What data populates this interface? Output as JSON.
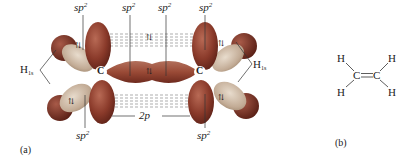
{
  "figure": {
    "panel_a": {
      "caption": "(a)",
      "top_labels": [
        {
          "base": "sp",
          "sup": "2"
        },
        {
          "base": "sp",
          "sup": "2"
        },
        {
          "base": "sp",
          "sup": "2"
        },
        {
          "base": "sp",
          "sup": "2"
        }
      ],
      "bottom_labels": [
        {
          "base": "sp",
          "sup": "2"
        },
        {
          "base": "2p",
          "sup": ""
        },
        {
          "base": "sp",
          "sup": "2"
        }
      ],
      "left_h_label": {
        "base": "H",
        "sub": "1s"
      },
      "right_h_label": {
        "base": "H",
        "sub": "1s"
      },
      "carbon_label": "C",
      "electron_pair_symbol": "⇅",
      "colors": {
        "lobe_dark": "#8a3a2a",
        "lobe_light": "#c9b9a8",
        "hydrogen": "#7a3526",
        "dash_lines": "#888888"
      }
    },
    "panel_b": {
      "caption": "(b)",
      "atoms": {
        "carbon": "C",
        "hydrogen": "H"
      },
      "bond": "C=C"
    }
  }
}
